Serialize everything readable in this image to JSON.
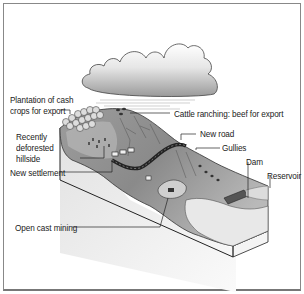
{
  "diagram": {
    "type": "cross-section illustration",
    "labels": [
      {
        "id": "plantation",
        "text_lines": [
          "Plantation of cash",
          "crops for export"
        ]
      },
      {
        "id": "cattle",
        "text_lines": [
          "Cattle ranching: beef for export"
        ]
      },
      {
        "id": "deforested",
        "text_lines": [
          "Recently",
          "deforested",
          "hillside"
        ]
      },
      {
        "id": "new_road",
        "text_lines": [
          "New road"
        ]
      },
      {
        "id": "gullies",
        "text_lines": [
          "Gullies"
        ]
      },
      {
        "id": "settlement",
        "text_lines": [
          "New settlement"
        ]
      },
      {
        "id": "dam",
        "text_lines": [
          "Dam"
        ]
      },
      {
        "id": "reservoir",
        "text_lines": [
          "Reservoir"
        ]
      },
      {
        "id": "mining",
        "text_lines": [
          "Open cast mining"
        ]
      }
    ],
    "colors": {
      "hill_dark": "#7a7a7a",
      "hill_mid": "#a9a9a9",
      "hill_light": "#d6d6d6",
      "block_face": "#ececec",
      "road": "#333333",
      "outline": "#222222",
      "cloud": "#bdbdbd"
    }
  }
}
